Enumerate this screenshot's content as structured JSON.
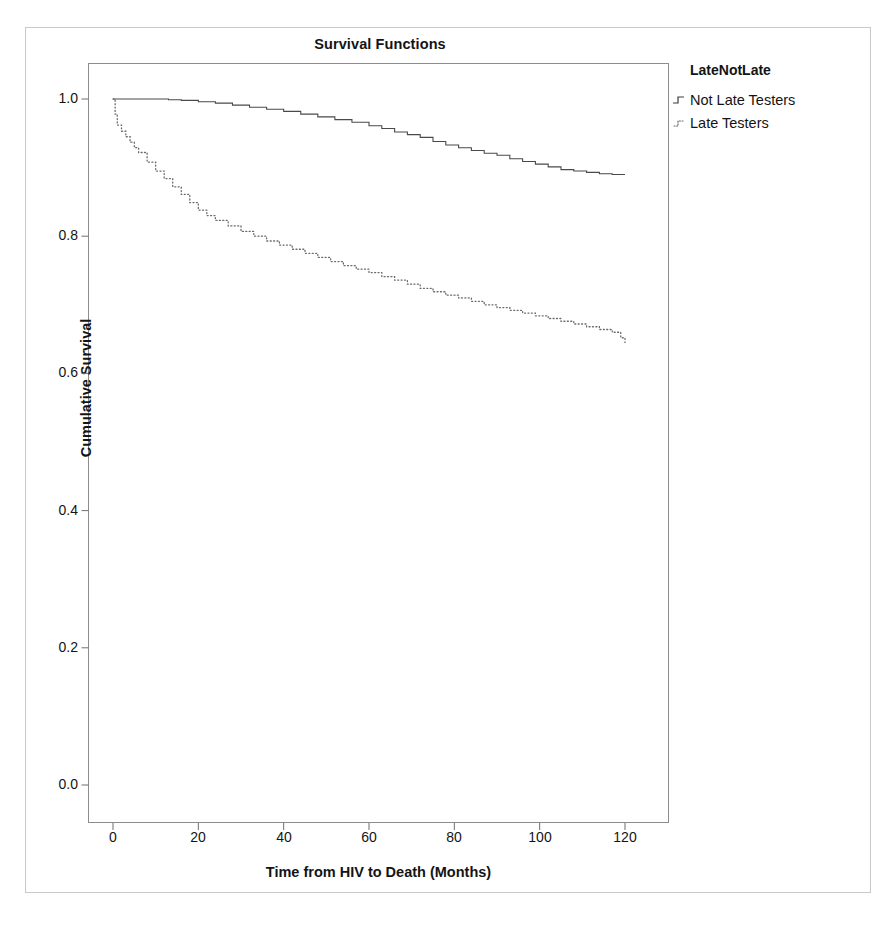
{
  "chart_data": {
    "type": "line",
    "title": "Survival Functions",
    "xlabel": "Time from HIV to Death (Months)",
    "ylabel": "Cumulative Survival",
    "xlim": [
      -3,
      126
    ],
    "ylim": [
      -0.05,
      1.06
    ],
    "xticks": [
      0,
      20,
      40,
      60,
      80,
      100,
      120
    ],
    "xtick_labels": [
      "0",
      "20",
      "40",
      "60",
      "80",
      "100",
      "120"
    ],
    "yticks": [
      0.0,
      0.2,
      0.4,
      0.6,
      0.8,
      1.0
    ],
    "ytick_labels": [
      "0.0",
      "0.2",
      "0.4",
      "0.6",
      "0.8",
      "1.0"
    ],
    "grid": false,
    "legend_position": "right",
    "legend_title": "LateNotLate",
    "series": [
      {
        "name": "Not Late Testers",
        "style": "solid",
        "color": "#4a4a4a",
        "x": [
          0,
          2,
          6,
          10,
          13,
          16,
          20,
          24,
          28,
          32,
          36,
          40,
          44,
          48,
          52,
          56,
          60,
          63,
          66,
          69,
          72,
          75,
          78,
          81,
          84,
          87,
          90,
          93,
          96,
          99,
          102,
          105,
          108,
          111,
          114,
          117,
          120
        ],
        "y": [
          1.0,
          1.0,
          1.0,
          1.0,
          0.999,
          0.998,
          0.996,
          0.994,
          0.991,
          0.988,
          0.985,
          0.982,
          0.978,
          0.974,
          0.97,
          0.966,
          0.961,
          0.957,
          0.952,
          0.948,
          0.944,
          0.938,
          0.933,
          0.929,
          0.925,
          0.921,
          0.918,
          0.913,
          0.909,
          0.905,
          0.901,
          0.897,
          0.895,
          0.893,
          0.891,
          0.89,
          0.89
        ]
      },
      {
        "name": "Late Testers",
        "style": "dotted",
        "color": "#6a6a6a",
        "x": [
          0,
          0.5,
          1,
          2,
          3,
          4,
          5,
          6,
          8,
          10,
          12,
          14,
          16,
          18,
          20,
          22,
          24,
          27,
          30,
          33,
          36,
          39,
          42,
          45,
          48,
          51,
          54,
          57,
          60,
          63,
          66,
          69,
          72,
          75,
          78,
          81,
          84,
          87,
          90,
          93,
          96,
          99,
          102,
          105,
          108,
          111,
          114,
          117,
          119,
          120
        ],
        "y": [
          1.0,
          0.978,
          0.962,
          0.953,
          0.945,
          0.937,
          0.929,
          0.922,
          0.908,
          0.895,
          0.884,
          0.872,
          0.861,
          0.849,
          0.838,
          0.83,
          0.823,
          0.815,
          0.807,
          0.8,
          0.793,
          0.787,
          0.781,
          0.775,
          0.769,
          0.763,
          0.757,
          0.752,
          0.747,
          0.741,
          0.736,
          0.73,
          0.724,
          0.719,
          0.714,
          0.71,
          0.705,
          0.7,
          0.696,
          0.692,
          0.688,
          0.684,
          0.68,
          0.676,
          0.672,
          0.668,
          0.664,
          0.66,
          0.652,
          0.645
        ]
      }
    ]
  },
  "legend": {
    "title": "LateNotLate",
    "items": [
      {
        "label": "Not Late Testers",
        "style": "solid"
      },
      {
        "label": "Late Testers",
        "style": "dotted"
      }
    ]
  },
  "axes": {
    "title": "Survival Functions",
    "xlabel": "Time from HIV to Death (Months)",
    "ylabel": "Cumulative Survival",
    "xtick_labels": [
      "0",
      "20",
      "40",
      "60",
      "80",
      "100",
      "120"
    ],
    "ytick_labels": [
      "0.0",
      "0.2",
      "0.4",
      "0.6",
      "0.8",
      "1.0"
    ]
  }
}
